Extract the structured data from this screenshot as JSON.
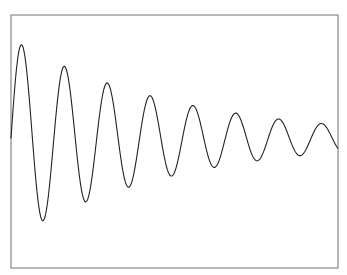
{
  "chart_data": {
    "type": "line",
    "title": "",
    "xlabel": "",
    "ylabel": "",
    "grid": false,
    "legend": null,
    "function": "y = A0 * exp(-k * x) * sin(2*pi*x / period)",
    "params": {
      "A0": 1.0,
      "decay_per_period": 0.77,
      "num_periods": 7.63,
      "start_phase": "rising zero-crossing"
    },
    "series": [
      {
        "name": "damped oscillation",
        "color": "#000000",
        "peaks": [
          {
            "cycle": 1,
            "value": 1.0
          },
          {
            "cycle": 2,
            "value": 0.77
          },
          {
            "cycle": 3,
            "value": 0.59
          },
          {
            "cycle": 4,
            "value": 0.45
          },
          {
            "cycle": 5,
            "value": 0.35
          },
          {
            "cycle": 6,
            "value": 0.27
          },
          {
            "cycle": 7,
            "value": 0.21
          },
          {
            "cycle": 8,
            "value": 0.16
          }
        ],
        "troughs": [
          {
            "cycle": 1,
            "value": -0.88
          },
          {
            "cycle": 2,
            "value": -0.68
          },
          {
            "cycle": 3,
            "value": -0.52
          },
          {
            "cycle": 4,
            "value": -0.4
          },
          {
            "cycle": 5,
            "value": -0.31
          },
          {
            "cycle": 6,
            "value": -0.24
          },
          {
            "cycle": 7,
            "value": -0.18
          }
        ]
      }
    ]
  },
  "render": {
    "frame": {
      "x0": 11,
      "y0": 15,
      "x1": 338,
      "y1": 268,
      "color": "#888888"
    },
    "line_color": "#222222",
    "midline_y": 138.5,
    "amplitude_px": 100,
    "period_px": 42.85,
    "decay_ratio_per_period": 0.77
  }
}
